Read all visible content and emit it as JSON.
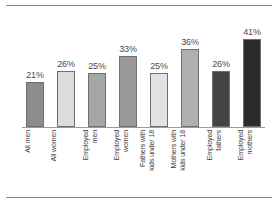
{
  "chart_data": {
    "type": "bar",
    "title": "",
    "subtitle": "",
    "xlabel": "",
    "ylabel": "",
    "ylim": [
      0,
      45
    ],
    "grid": false,
    "legend": "none",
    "value_suffix": "%",
    "categories": [
      "All men",
      "All women",
      "Employed men",
      "Employed women",
      "Fathers with kids under 18",
      "Mothers with kids under 18",
      "Employed fathers",
      "Employed mothers"
    ],
    "values": [
      21,
      26,
      25,
      33,
      25,
      36,
      26,
      41
    ],
    "value_labels": [
      "21%",
      "26%",
      "25%",
      "33%",
      "25%",
      "36%",
      "26%",
      "41%"
    ],
    "bar_colors": [
      "#8c8c8c",
      "#dcdcdc",
      "#a6a6a6",
      "#9a9a9a",
      "#e2e2e2",
      "#b0b0b0",
      "#444444",
      "#2b2b2b"
    ],
    "bars": [
      {
        "label_line1": "All men",
        "label_line2": "",
        "value_label": "21%",
        "value": 21,
        "color": "#8c8c8c"
      },
      {
        "label_line1": "All women",
        "label_line2": "",
        "value_label": "26%",
        "value": 26,
        "color": "#dcdcdc"
      },
      {
        "label_line1": "Employed",
        "label_line2": "men",
        "value_label": "25%",
        "value": 25,
        "color": "#a6a6a6"
      },
      {
        "label_line1": "Employed",
        "label_line2": "women",
        "value_label": "33%",
        "value": 33,
        "color": "#9a9a9a"
      },
      {
        "label_line1": "Fathers with",
        "label_line2": "kids under 18",
        "value_label": "25%",
        "value": 25,
        "color": "#e2e2e2"
      },
      {
        "label_line1": "Mothers with",
        "label_line2": "kids under 18",
        "value_label": "36%",
        "value": 36,
        "color": "#b0b0b0"
      },
      {
        "label_line1": "Employed",
        "label_line2": "fathers",
        "value_label": "26%",
        "value": 26,
        "color": "#444444"
      },
      {
        "label_line1": "Employed",
        "label_line2": "mothers",
        "value_label": "41%",
        "value": 41,
        "color": "#2b2b2b"
      }
    ]
  },
  "figure": {
    "axis_color": "#9a9a9a",
    "rule_color": "#8a8a8a",
    "background": "#ffffff"
  }
}
